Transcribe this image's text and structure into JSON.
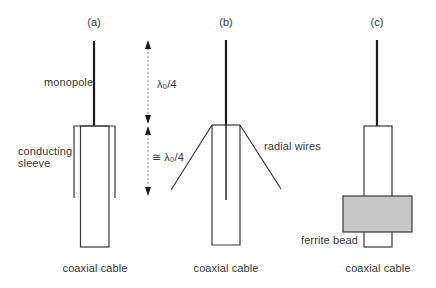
{
  "panels": {
    "a": {
      "label": "(a)",
      "monopole_label": "monopole",
      "sleeve_label_line1": "conducting",
      "sleeve_label_line2": "sleeve",
      "cable_label": "coaxial cable"
    },
    "b": {
      "label": "(b)",
      "radial_label": "radial wires",
      "cable_label": "coaxial cable"
    },
    "c": {
      "label": "(c)",
      "ferrite_label": "ferrite bead",
      "cable_label": "coaxial cable"
    }
  },
  "dimensions": {
    "upper_label": "λ₀/4",
    "lower_label": "≅ λ₀/4"
  },
  "colors": {
    "line": "#3a3a3a",
    "monopole": "#1a1a1a",
    "ferrite_fill": "#c8c8c8",
    "dashed": "#8a8a8a"
  }
}
